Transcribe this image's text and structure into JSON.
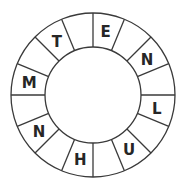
{
  "puzzle": {
    "type": "letter-wheel",
    "segment_count": 16,
    "center": [
      93,
      95
    ],
    "outer_radius": 82,
    "inner_radius": 48,
    "letter_radius": 65,
    "line_color": "#3a3a3a",
    "letter_color": "#262626",
    "segments": [
      {
        "index": 0,
        "letter": "E"
      },
      {
        "index": 1,
        "letter": ""
      },
      {
        "index": 2,
        "letter": "N"
      },
      {
        "index": 3,
        "letter": ""
      },
      {
        "index": 4,
        "letter": "L"
      },
      {
        "index": 5,
        "letter": ""
      },
      {
        "index": 6,
        "letter": "U"
      },
      {
        "index": 7,
        "letter": ""
      },
      {
        "index": 8,
        "letter": "H"
      },
      {
        "index": 9,
        "letter": ""
      },
      {
        "index": 10,
        "letter": "N"
      },
      {
        "index": 11,
        "letter": ""
      },
      {
        "index": 12,
        "letter": "M"
      },
      {
        "index": 13,
        "letter": ""
      },
      {
        "index": 14,
        "letter": "T"
      },
      {
        "index": 15,
        "letter": ""
      }
    ]
  }
}
